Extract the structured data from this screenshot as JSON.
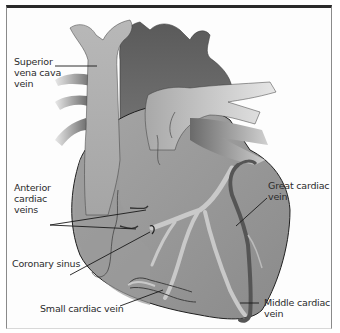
{
  "figure": {
    "colors": {
      "heart_body": "#8f8f8f",
      "heart_light": "#b4b4b4",
      "heart_dark": "#5c5c5c",
      "vein_light": "#c9c9c9",
      "vein_dark": "#555555",
      "outline": "#222222",
      "frame_top": "#2a2a2a"
    }
  },
  "labels": {
    "superior_vena_cava": [
      "Superior",
      "vena cava",
      "vein"
    ],
    "anterior_cardiac_veins": [
      "Anterior",
      "cardiac",
      "veins"
    ],
    "coronary_sinus": [
      "Coronary sinus"
    ],
    "small_cardiac_vein": [
      "Small cardiac vein"
    ],
    "great_cardiac_vein": [
      "Great cardiac",
      "vein"
    ],
    "middle_cardiac_vein": [
      "Middle cardiac",
      "vein"
    ]
  }
}
